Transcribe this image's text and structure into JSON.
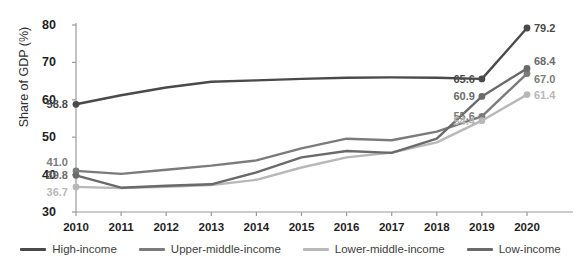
{
  "legend": {
    "position": "bottom",
    "items": [
      {
        "label": "High-income",
        "color": "#4a4a4a"
      },
      {
        "label": "Upper-middle-income",
        "color": "#7b7b7b"
      },
      {
        "label": "Lower-middle-income",
        "color": "#b8b8b8"
      },
      {
        "label": "Low-income",
        "color": "#6a6a6a"
      }
    ]
  },
  "axes": {
    "ylabel": "Share of GDP (%)",
    "yticks": [
      "30",
      "40",
      "50",
      "60",
      "70",
      "80"
    ],
    "xticks": [
      "2010",
      "2011",
      "2012",
      "2013",
      "2014",
      "2015",
      "2016",
      "2017",
      "2018",
      "2019",
      "2020"
    ]
  },
  "endpoint_labels": {
    "left": [
      {
        "text": "58.8",
        "color": "#4a4a4a"
      },
      {
        "text": "41.0",
        "color": "#4a4a4a"
      },
      {
        "text": "39.8",
        "color": "#6a6a6a"
      },
      {
        "text": "36.7",
        "color": "#b8b8b8"
      }
    ],
    "right": [
      {
        "text": "79.2",
        "color": "#303030"
      },
      {
        "text": "68.4",
        "color": "#5a5a5a"
      },
      {
        "text": "67.0",
        "color": "#5a5a5a"
      },
      {
        "text": "61.4",
        "color": "#b8b8b8"
      },
      {
        "text": "65.6",
        "color": "#303030"
      },
      {
        "text": "60.9",
        "color": "#5a5a5a"
      },
      {
        "text": "55.6",
        "color": "#5a5a5a"
      },
      {
        "text": "54.4",
        "color": "#b8b8b8"
      }
    ]
  },
  "chart_data": {
    "type": "line",
    "title": "",
    "xlabel": "",
    "ylabel": "Share of GDP (%)",
    "x": [
      2010,
      2011,
      2012,
      2013,
      2014,
      2015,
      2016,
      2017,
      2018,
      2019,
      2020
    ],
    "ylim": [
      30,
      80
    ],
    "xlim": [
      2010,
      2020
    ],
    "grid": false,
    "legend_position": "bottom",
    "series": [
      {
        "name": "High-income",
        "color": "#4a4a4a",
        "values": [
          58.8,
          61.2,
          63.3,
          64.8,
          65.2,
          65.6,
          65.9,
          66.0,
          65.9,
          65.6,
          79.2
        ],
        "labels": {
          "2010": "58.8",
          "2019": "65.6",
          "2020": "79.2"
        }
      },
      {
        "name": "Upper-middle-income",
        "color": "#7b7b7b",
        "values": [
          41.0,
          40.2,
          41.3,
          42.4,
          43.8,
          47.0,
          49.6,
          49.2,
          51.5,
          55.6,
          67.0
        ],
        "labels": {
          "2010": "41.0",
          "2019": "55.6",
          "2020": "67.0"
        }
      },
      {
        "name": "Lower-middle-income",
        "color": "#b8b8b8",
        "values": [
          36.7,
          36.4,
          36.7,
          37.2,
          38.6,
          41.9,
          44.6,
          45.9,
          48.6,
          54.4,
          61.4
        ],
        "labels": {
          "2010": "36.7",
          "2019": "54.4",
          "2020": "61.4"
        }
      },
      {
        "name": "Low-income",
        "color": "#6a6a6a",
        "values": [
          39.8,
          36.5,
          37.0,
          37.4,
          40.6,
          44.6,
          46.3,
          45.8,
          49.6,
          60.9,
          68.4
        ],
        "labels": {
          "2010": "39.8",
          "2019": "60.9",
          "2020": "68.4"
        }
      }
    ]
  }
}
